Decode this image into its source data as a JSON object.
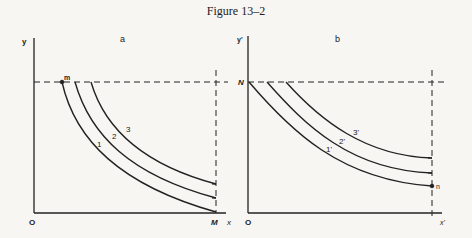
{
  "figure": {
    "title": "Figure 13–2",
    "colors": {
      "ink": "#222222",
      "background": "#f7f6f3"
    }
  },
  "panels": [
    {
      "id": "a",
      "label": "a",
      "y_axis_label": "y",
      "x_axis_label": "x",
      "origin_label": "O",
      "x_end_label": "M",
      "point_label": "m",
      "curves": [
        {
          "label": "1",
          "start": [
            62,
            82
          ],
          "end": [
            216,
            212
          ]
        },
        {
          "label": "2",
          "start": [
            75,
            82
          ],
          "end": [
            216,
            198
          ]
        },
        {
          "label": "3",
          "start": [
            91,
            82
          ],
          "end": [
            216,
            184
          ]
        }
      ]
    },
    {
      "id": "b",
      "label": "b",
      "y_axis_label": "y'",
      "x_axis_label": "x'",
      "origin_label": "O",
      "y_start_label": "N",
      "point_label": "n",
      "curves": [
        {
          "label": "1'",
          "start": [
            249,
            82
          ],
          "end": [
            432,
            186
          ]
        },
        {
          "label": "2'",
          "start": [
            267,
            82
          ],
          "end": [
            432,
            173
          ]
        },
        {
          "label": "3'",
          "start": [
            286,
            82
          ],
          "end": [
            432,
            158
          ]
        }
      ]
    }
  ]
}
